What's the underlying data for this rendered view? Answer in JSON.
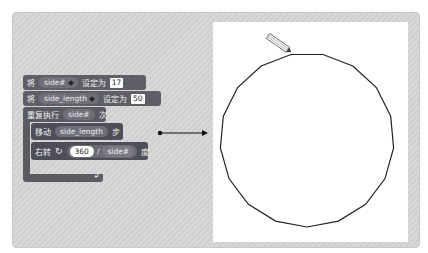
{
  "scripts": {
    "set_side_num": {
      "label_prefix": "将",
      "variable": "side#",
      "label_suffix": "设定为",
      "value": "17"
    },
    "set_side_length": {
      "label_prefix": "将",
      "variable": "side_length",
      "label_suffix": "设定为",
      "value": "50"
    },
    "repeat": {
      "label_prefix": "重复执行",
      "count_var": "side#",
      "label_suffix": "次"
    },
    "move": {
      "label_prefix": "移动",
      "steps_var": "side_length",
      "label_suffix": "步"
    },
    "turn": {
      "label_prefix": "右转",
      "icon": "rotate-clockwise-icon",
      "numerator": "360",
      "operator": "/",
      "denominator_var": "side#",
      "label_suffix": "度"
    },
    "loop_end_icon": "loop-arrow-icon"
  },
  "connector": {
    "icon": "arrow-right-icon"
  },
  "stage": {
    "shape": "regular-polygon",
    "sides": 17,
    "sprite_icon": "pencil-icon",
    "colors": {
      "stroke": "#222222",
      "background": "#ffffff"
    }
  },
  "colors": {
    "frame_bg": "#d4d4d4",
    "block_data": "#5e5e66",
    "block_control": "#5a5a62",
    "block_motion": "#4e4e58"
  }
}
